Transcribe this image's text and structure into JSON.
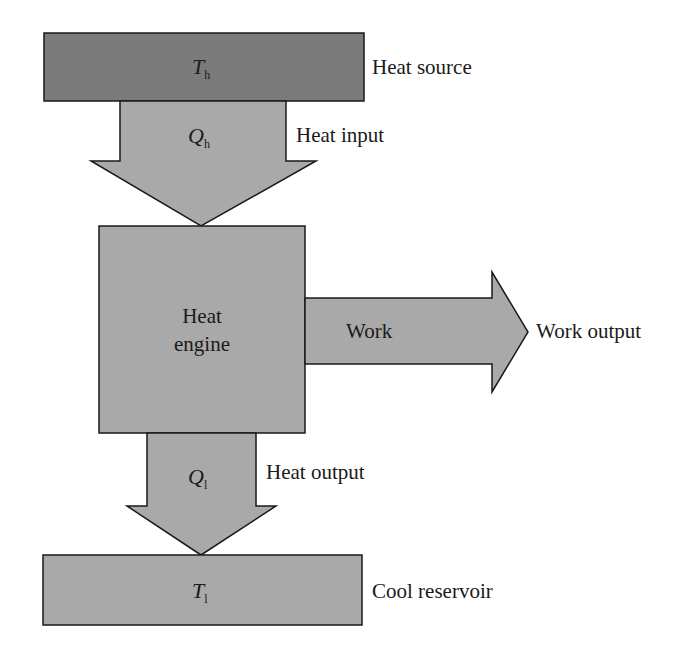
{
  "diagram": {
    "colors": {
      "heat_source_fill": "#7b7b7b",
      "shape_fill": "#a9a9a9",
      "stroke": "#1a1a1a",
      "background": "#ffffff"
    },
    "nodes": {
      "heat_source": {
        "symbol": "T",
        "subscript": "h",
        "label": "Heat source"
      },
      "engine": {
        "line1": "Heat",
        "line2": "engine"
      },
      "cool_reservoir": {
        "symbol": "T",
        "subscript": "l",
        "label": "Cool reservoir"
      }
    },
    "flows": {
      "heat_input": {
        "symbol": "Q",
        "subscript": "h",
        "label": "Heat input"
      },
      "work": {
        "inner_label": "Work",
        "label": "Work output"
      },
      "heat_output": {
        "symbol": "Q",
        "subscript": "l",
        "label": "Heat output"
      }
    }
  }
}
